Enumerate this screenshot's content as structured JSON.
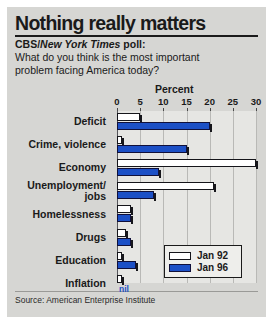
{
  "title": "Nothing really matters",
  "poll": {
    "prefix": "CBS/",
    "publication": "New York Times",
    "suffix": " poll:"
  },
  "question": "What do you think is the most important problem facing America today?",
  "source": "Source: American Enterprise Institute",
  "nil_note": "nil",
  "colors": {
    "series_old": "#ffffff",
    "series_new": "#1c50c6",
    "background": "#d6d6d3",
    "plot_background": "#e6e6e3",
    "text": "#1a1a1a"
  },
  "chart_data": {
    "type": "bar",
    "orientation": "horizontal",
    "title": "Nothing really matters",
    "subtitle": "CBS/New York Times poll: What do you think is the most important problem facing America today?",
    "xlabel": "Percent",
    "ylabel": "",
    "xlim": [
      0,
      30
    ],
    "xticks": [
      0,
      5,
      10,
      15,
      20,
      25,
      30
    ],
    "xtick_labels": [
      "0",
      "5",
      "10",
      "15",
      "20",
      "25",
      "30"
    ],
    "grid": true,
    "legend_position": "bottom-right",
    "categories": [
      "Deficit",
      "Crime, violence",
      "Economy",
      "Unemployment/ jobs",
      "Homelessness",
      "Drugs",
      "Education",
      "Inflation"
    ],
    "series": [
      {
        "name": "Jan 92",
        "color": "#ffffff",
        "values": [
          5,
          1,
          30,
          21,
          3,
          2,
          1,
          1
        ]
      },
      {
        "name": "Jan 96",
        "color": "#1c50c6",
        "values": [
          20,
          15,
          9,
          8,
          3,
          3,
          4,
          0
        ]
      }
    ],
    "annotations": [
      {
        "text": "nil",
        "category": "Inflation",
        "series": "Jan 96",
        "value": 0
      }
    ]
  }
}
